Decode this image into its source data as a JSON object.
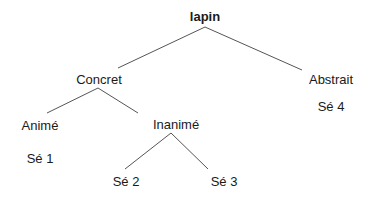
{
  "tree": {
    "root": {
      "id": "lapin",
      "label": "lapin",
      "x": 205,
      "y": 17
    },
    "nodes": [
      {
        "id": "concret",
        "label": "Concret",
        "x": 99,
        "y": 80
      },
      {
        "id": "abstrait",
        "label": "Abstrait",
        "x": 331,
        "y": 80
      },
      {
        "id": "anime",
        "label": "Animé",
        "x": 40,
        "y": 126
      },
      {
        "id": "inanime",
        "label": "Inanimé",
        "x": 176,
        "y": 125
      },
      {
        "id": "se1",
        "label": "Sé 1",
        "x": 40,
        "y": 159
      },
      {
        "id": "se2",
        "label": "Sé 2",
        "x": 126,
        "y": 182
      },
      {
        "id": "se3",
        "label": "Sé 3",
        "x": 224,
        "y": 182
      },
      {
        "id": "se4",
        "label": "Sé 4",
        "x": 331,
        "y": 107
      }
    ],
    "edges": [
      {
        "from": "lapin",
        "to": "concret",
        "x1": 205,
        "y1": 27,
        "x2": 118,
        "y2": 68
      },
      {
        "from": "lapin",
        "to": "abstrait",
        "x1": 205,
        "y1": 27,
        "x2": 302,
        "y2": 70
      },
      {
        "from": "concret",
        "to": "anime",
        "x1": 98,
        "y1": 88,
        "x2": 47,
        "y2": 113
      },
      {
        "from": "concret",
        "to": "inanime",
        "x1": 98,
        "y1": 88,
        "x2": 138,
        "y2": 113
      },
      {
        "from": "inanime",
        "to": "se2",
        "x1": 171,
        "y1": 133,
        "x2": 125,
        "y2": 169
      },
      {
        "from": "inanime",
        "to": "se3",
        "x1": 171,
        "y1": 133,
        "x2": 208,
        "y2": 169
      }
    ]
  }
}
